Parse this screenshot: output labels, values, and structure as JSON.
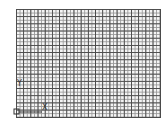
{
  "app": {
    "type": "cad-drawing-viewport"
  },
  "viewport": {
    "grid": {
      "visible": true,
      "minor_color": "#9a9a9a",
      "major_color": "#4a4a4a",
      "background": "#f4f4f4"
    },
    "ucs_icon": {
      "x_label": "X",
      "y_label": "Y"
    }
  }
}
